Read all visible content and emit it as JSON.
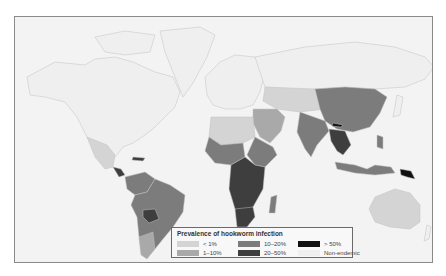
{
  "legend": {
    "title": "Prevalence of hookworm infection",
    "items": [
      {
        "label": "< 1%",
        "color": "#d4d4d4"
      },
      {
        "label": "1–10%",
        "color": "#a9a9a9"
      },
      {
        "label": "10–20%",
        "color": "#7c7c7c"
      },
      {
        "label": "20–50%",
        "color": "#3e3e3e"
      },
      {
        "label": "> 50%",
        "color": "#111111"
      },
      {
        "label": "Non-endemic",
        "color": "#efefef"
      }
    ]
  },
  "map": {
    "ocean_color": "#f3f3f3",
    "border_color": "#8a8a8a",
    "regions": [
      {
        "name": "North America",
        "category": "Non-endemic"
      },
      {
        "name": "Greenland",
        "category": "Non-endemic"
      },
      {
        "name": "Europe",
        "category": "Non-endemic"
      },
      {
        "name": "Russia",
        "category": "Non-endemic"
      },
      {
        "name": "Mexico",
        "category": "< 1%"
      },
      {
        "name": "Central America",
        "category": "20–50%"
      },
      {
        "name": "South America",
        "category": "10–20%"
      },
      {
        "name": "Bolivia",
        "category": "20–50%"
      },
      {
        "name": "Colombia/Venezuela",
        "category": "10–20%"
      },
      {
        "name": "North Africa",
        "category": "< 1%"
      },
      {
        "name": "West Africa",
        "category": "10–20%"
      },
      {
        "name": "Central/East Africa",
        "category": "20–50%"
      },
      {
        "name": "Southern Africa",
        "category": "20–50%"
      },
      {
        "name": "Middle East",
        "category": "1–10%"
      },
      {
        "name": "Central Asia",
        "category": "< 1%"
      },
      {
        "name": "China",
        "category": "10–20%"
      },
      {
        "name": "India",
        "category": "10–20%"
      },
      {
        "name": "Southeast Asia",
        "category": "20–50%"
      },
      {
        "name": "Indonesia",
        "category": "10–20%"
      },
      {
        "name": "Papua New Guinea",
        "category": "> 50%"
      },
      {
        "name": "Australia",
        "category": "< 1%"
      }
    ]
  }
}
